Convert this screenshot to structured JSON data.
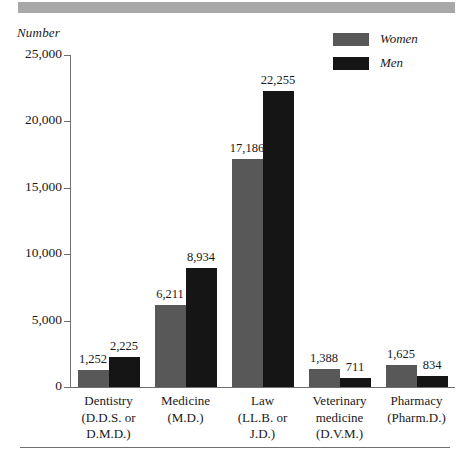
{
  "chart_data": {
    "type": "bar",
    "title": "",
    "xlabel": "",
    "ylabel": "Number",
    "ylim": [
      0,
      25000
    ],
    "grid": false,
    "legend_position": "top-right",
    "categories": [
      "Dentistry\n(D.D.S. or\nD.M.D.)",
      "Medicine\n(M.D.)",
      "Law\n(LL.B. or\nJ.D.)",
      "Veterinary\nmedicine\n(D.V.M.)",
      "Pharmacy\n(Pharm.D.)"
    ],
    "category_lines": [
      [
        "Dentistry",
        "(D.D.S. or",
        "D.M.D.)"
      ],
      [
        "Medicine",
        "(M.D.)"
      ],
      [
        "Law",
        "(LL.B. or",
        "J.D.)"
      ],
      [
        "Veterinary",
        "medicine",
        "(D.V.M.)"
      ],
      [
        "Pharmacy",
        "(Pharm.D.)"
      ]
    ],
    "series": [
      {
        "name": "Women",
        "color": "#585858",
        "values": [
          1252,
          6211,
          17186,
          1388,
          1625
        ],
        "labels": [
          "1,252",
          "6,211",
          "17,186",
          "1,388",
          "1,625"
        ]
      },
      {
        "name": "Men",
        "color": "#151515",
        "values": [
          2225,
          8934,
          22255,
          711,
          834
        ],
        "labels": [
          "2,225",
          "8,934",
          "22,255",
          "711",
          "834"
        ]
      }
    ],
    "y_ticks": [
      0,
      5000,
      10000,
      15000,
      20000,
      25000
    ],
    "y_tick_labels": [
      "0",
      "5,000",
      "10,000",
      "15,000",
      "20,000",
      "25,000"
    ]
  },
  "legend": {
    "items": [
      {
        "label": "Women",
        "color": "#585858"
      },
      {
        "label": "Men",
        "color": "#151515"
      }
    ]
  },
  "axis": {
    "y_title": "Number"
  },
  "colors": {
    "women": "#585858",
    "men": "#151515",
    "axis": "#6f6f6f",
    "band": "#a8a8a8",
    "rule": "#707070",
    "text": "#1a1a1a"
  }
}
